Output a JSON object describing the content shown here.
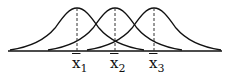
{
  "diagram": {
    "type": "overlapping-normal-distributions",
    "curves": [
      {
        "mean_label": "x",
        "subscript": "1",
        "center_px": 77
      },
      {
        "mean_label": "x",
        "subscript": "2",
        "center_px": 115
      },
      {
        "mean_label": "x",
        "subscript": "3",
        "center_px": 154
      }
    ],
    "line_color": "#111111"
  }
}
